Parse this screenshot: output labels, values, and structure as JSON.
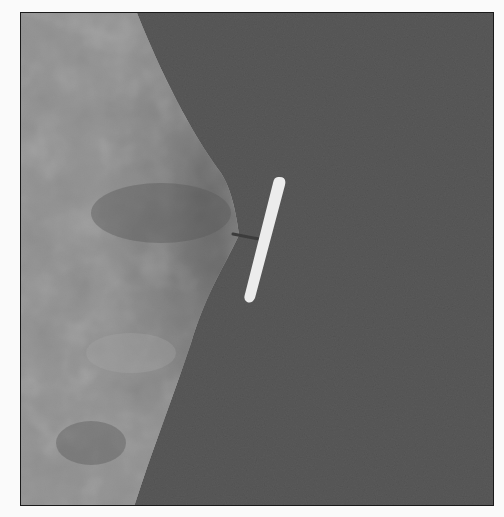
{
  "image": {
    "description": "Grayscale photograph: textured fabric on left with a white plastic tag fastener pin attached at its pointed edge, against a dark gray background",
    "colors": {
      "background": "#565656",
      "fabric_light": "#a8a8a8",
      "fabric_dark": "#555555",
      "tag": "#ececec",
      "border": "#1a1a1a",
      "page": "#fafafa"
    }
  }
}
